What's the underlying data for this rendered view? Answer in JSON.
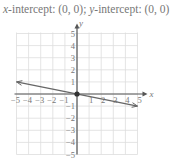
{
  "caption": {
    "x_label": "x",
    "x_text": "-intercept: (0, 0); ",
    "y_label": "y",
    "y_text": "-intercept: (0, 0)"
  },
  "chart_data": {
    "type": "line",
    "title": "x-intercept: (0, 0); y-intercept: (0, 0)",
    "xlabel": "x",
    "ylabel": "y",
    "xlim": [
      -5,
      5
    ],
    "ylim": [
      -5,
      5
    ],
    "grid": true,
    "x_ticks": [
      "-5",
      "-4",
      "-3",
      "-2",
      "-1",
      "1",
      "2",
      "3",
      "4",
      "5"
    ],
    "y_ticks": [
      "5",
      "4",
      "3",
      "2",
      "1",
      "-1",
      "-2",
      "-3",
      "-4",
      "-5"
    ],
    "series": [
      {
        "name": "line",
        "x": [
          -5,
          0,
          5
        ],
        "y": [
          1,
          0,
          -1
        ],
        "arrows": true
      }
    ],
    "points": [
      {
        "x": 0,
        "y": 0,
        "label": "intercept"
      }
    ],
    "colors": {
      "grid": "#dddddd",
      "axis": "#555555",
      "line": "#666666",
      "text": "#777777"
    }
  }
}
